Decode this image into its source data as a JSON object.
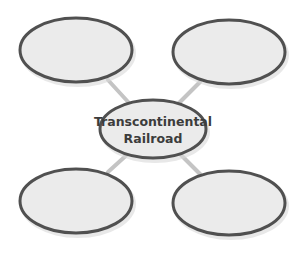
{
  "diagram": {
    "type": "concept-web",
    "center": {
      "label_line1": "Transcontinental",
      "label_line2": "Railroad"
    },
    "branches": [
      {
        "position": "top-left",
        "label": ""
      },
      {
        "position": "top-right",
        "label": ""
      },
      {
        "position": "bottom-left",
        "label": ""
      },
      {
        "position": "bottom-right",
        "label": ""
      }
    ],
    "colors": {
      "node_fill": "#ebebeb",
      "node_stroke": "#505050",
      "connector": "#c4c4c4",
      "text": "#3c3c3c"
    }
  }
}
